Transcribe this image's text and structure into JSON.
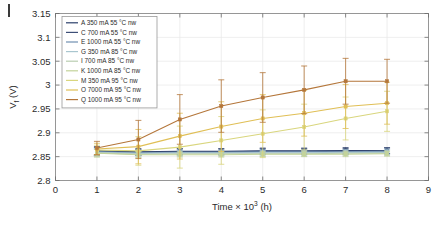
{
  "chart_data": {
    "type": "line",
    "title": "",
    "xlabel": "Time × 10³ (h)",
    "ylabel": "V_f (V)",
    "xlim": [
      0,
      9
    ],
    "ylim": [
      2.8,
      3.15
    ],
    "xticks": [
      "0",
      "1",
      "2",
      "3",
      "4",
      "5",
      "6",
      "7",
      "8",
      "9"
    ],
    "yticks": [
      "2.8",
      "2.85",
      "2.9",
      "2.95",
      "3",
      "3.05",
      "3.1",
      "3.15"
    ],
    "grid": true,
    "legend_position": "upper-left",
    "x": [
      1,
      2,
      3,
      4,
      5,
      6,
      7,
      8
    ],
    "series": [
      {
        "name": "A 350 mA 55 °C nw",
        "color": "#2b3f6b",
        "values": [
          2.862,
          2.86,
          2.861,
          2.861,
          2.862,
          2.862,
          2.863,
          2.863
        ],
        "err": [
          0.009,
          0.007,
          0.006,
          0.006,
          0.006,
          0.006,
          0.006,
          0.006
        ]
      },
      {
        "name": "C 700 mA 55 °C nw",
        "color": "#3d4f77",
        "values": [
          2.861,
          2.859,
          2.86,
          2.86,
          2.861,
          2.861,
          2.861,
          2.862
        ],
        "err": [
          0.008,
          0.006,
          0.006,
          0.006,
          0.006,
          0.006,
          0.006,
          0.006
        ]
      },
      {
        "name": "E 1000 mA 55 °C nw",
        "color": "#6f8fb0",
        "values": [
          2.86,
          2.858,
          2.859,
          2.859,
          2.86,
          2.86,
          2.86,
          2.861
        ],
        "err": [
          0.008,
          0.006,
          0.005,
          0.005,
          0.005,
          0.005,
          0.005,
          0.005
        ]
      },
      {
        "name": "G 350 mA 85 °C nw",
        "color": "#a9c6cf",
        "values": [
          2.859,
          2.857,
          2.858,
          2.858,
          2.858,
          2.858,
          2.859,
          2.859
        ],
        "err": [
          0.007,
          0.005,
          0.005,
          0.005,
          0.005,
          0.005,
          0.005,
          0.005
        ]
      },
      {
        "name": "I 700 mA 85 °C nw",
        "color": "#b9cdb0",
        "values": [
          2.858,
          2.855,
          2.856,
          2.856,
          2.856,
          2.856,
          2.857,
          2.857
        ],
        "err": [
          0.008,
          0.006,
          0.005,
          0.005,
          0.005,
          0.005,
          0.005,
          0.005
        ]
      },
      {
        "name": "K 1000 mA 85 °C nw",
        "color": "#c3d39a",
        "values": [
          2.857,
          2.854,
          2.854,
          2.854,
          2.855,
          2.855,
          2.855,
          2.856
        ],
        "err": [
          0.008,
          0.006,
          0.005,
          0.005,
          0.005,
          0.005,
          0.005,
          0.005
        ]
      },
      {
        "name": "M 350 mA 95 °C nw",
        "color": "#d9d67e",
        "values": [
          2.864,
          2.862,
          2.87,
          2.884,
          2.898,
          2.912,
          2.93,
          2.945
        ],
        "err": [
          0.01,
          0.03,
          0.044,
          0.05,
          0.05,
          0.048,
          0.045,
          0.042
        ]
      },
      {
        "name": "O 7000 mA 95 °C nw",
        "color": "#e0bf55",
        "values": [
          2.866,
          2.871,
          2.893,
          2.913,
          2.93,
          2.941,
          2.955,
          2.962
        ],
        "err": [
          0.012,
          0.036,
          0.048,
          0.052,
          0.05,
          0.048,
          0.046,
          0.044
        ]
      },
      {
        "name": "Q 1000 mA 95 °C nw",
        "color": "#b4763a",
        "values": [
          2.868,
          2.886,
          2.928,
          2.956,
          2.974,
          2.99,
          3.008,
          3.008
        ],
        "err": [
          0.014,
          0.04,
          0.052,
          0.055,
          0.052,
          0.05,
          0.048,
          0.046
        ]
      }
    ]
  }
}
